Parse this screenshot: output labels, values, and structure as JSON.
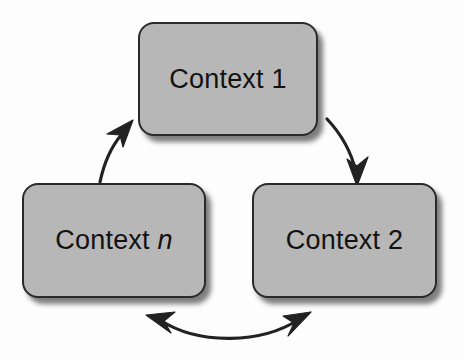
{
  "diagram": {
    "background_color": "#fdfdfd",
    "box_fill_color": "#b7b7b7",
    "box_border_color": "#2a2a2a",
    "arrow_color": "#222222",
    "nodes": [
      {
        "id": "context-1",
        "label_prefix": "Context",
        "label_suffix": "1",
        "suffix_italic": false,
        "position": "top-center"
      },
      {
        "id": "context-n",
        "label_prefix": "Context",
        "label_suffix": "n",
        "suffix_italic": true,
        "position": "bottom-left"
      },
      {
        "id": "context-2",
        "label_prefix": "Context",
        "label_suffix": "2",
        "suffix_italic": false,
        "position": "bottom-right"
      }
    ],
    "connectors": [
      {
        "id": "context-1-to-context-2",
        "from": "context-1",
        "to": "context-2",
        "style": "curved",
        "heads": "single"
      },
      {
        "id": "context-2-to-context-n",
        "from": "context-2",
        "to": "context-n",
        "style": "curved",
        "heads": "double"
      },
      {
        "id": "context-n-to-context-1",
        "from": "context-n",
        "to": "context-1",
        "style": "curved",
        "heads": "single"
      }
    ]
  }
}
